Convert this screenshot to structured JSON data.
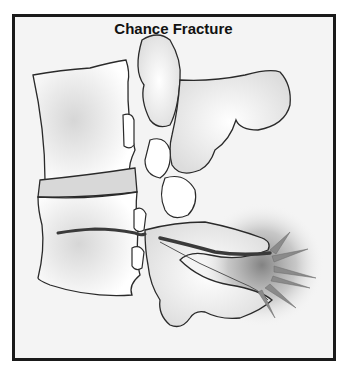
{
  "figure": {
    "title": "Chance Fracture",
    "colors": {
      "frame_border": "#1a1a1a",
      "background": "#f4f4f4",
      "bone_fill": "#ffffff",
      "bone_outline": "#2a2a2a",
      "fracture_line": "#3a3a3a",
      "pain_glow": "#808080"
    }
  }
}
